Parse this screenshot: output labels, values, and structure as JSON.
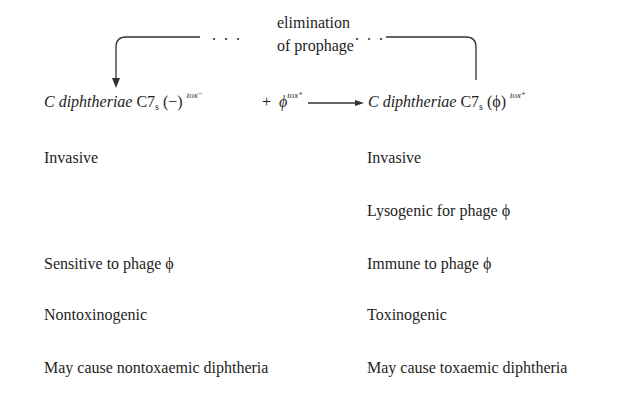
{
  "top_label": {
    "line1": "elimination",
    "line2": "of prophage",
    "dots_left": ". . .",
    "dots_right": ". . ."
  },
  "equation": {
    "left": {
      "genus": "C",
      "species": "diphtheriae",
      "strain": "C7",
      "strain_sub": "s",
      "phage_state": "(−)",
      "tox_sup": "tox⁻"
    },
    "plus": "+",
    "phage": "ϕ",
    "phage_sup": "tox⁺",
    "right": {
      "genus": "C",
      "species": "diphtheriae",
      "strain": "C7",
      "strain_sub": "s",
      "phage_state": "(ϕ)",
      "tox_sup": "tox⁺"
    }
  },
  "left_properties": [
    {
      "label": "Invasive",
      "row": 0
    },
    {
      "label": "Sensitive to phage ϕ",
      "row": 2
    },
    {
      "label": "Nontoxinogenic",
      "row": 3
    },
    {
      "label": "May cause nontoxaemic diphtheria",
      "row": 4
    }
  ],
  "right_properties": [
    {
      "label": "Invasive",
      "row": 0
    },
    {
      "label": "Lysogenic for phage ϕ",
      "row": 1
    },
    {
      "label": "Immune to phage ϕ",
      "row": 2
    },
    {
      "label": "Toxinogenic",
      "row": 3
    },
    {
      "label": "May cause toxaemic diphtheria",
      "row": 4
    }
  ]
}
